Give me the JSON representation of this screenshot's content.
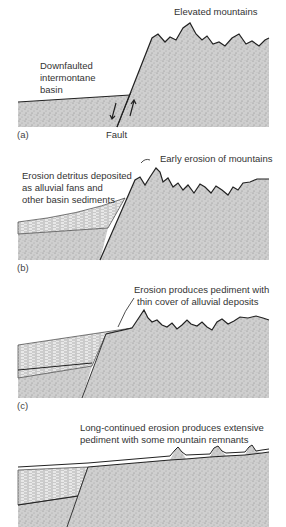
{
  "figure": {
    "panels": [
      {
        "id": "a",
        "label": "(a)",
        "annotations": {
          "mountains": "Elevated mountains",
          "basin_line1": "Downfaulted",
          "basin_line2": "intermontane",
          "basin_line3": "basin",
          "fault": "Fault"
        }
      },
      {
        "id": "b",
        "label": "(b)",
        "annotations": {
          "erosion": "Early erosion of mountains",
          "detritus_line1": "Erosion detritus deposited",
          "detritus_line2": "as alluvial fans and",
          "detritus_line3": "other basin sediments"
        }
      },
      {
        "id": "c",
        "label": "(c)",
        "annotations": {
          "pediment_line1": "Erosion produces pediment with",
          "pediment_line2": "thin cover of alluvial deposits"
        }
      },
      {
        "id": "d",
        "label": "",
        "annotations": {
          "long_line1": "Long-continued erosion produces extensive",
          "long_line2": "pediment with some mountain remnants"
        }
      }
    ],
    "colors": {
      "rock_fill": "#c9c9c9",
      "outline": "#222222",
      "text": "#333333",
      "sediment": "#e4e4e4"
    }
  }
}
